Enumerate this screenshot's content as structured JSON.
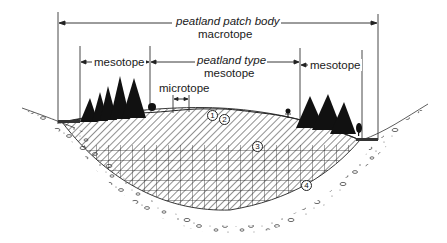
{
  "diagram": {
    "macrotope": {
      "title": "peatland patch body",
      "subtitle": "macrotope"
    },
    "mesotope_left": {
      "label": "mesotope"
    },
    "mesotope_center": {
      "title": "peatland type",
      "subtitle": "mesotope"
    },
    "mesotope_right": {
      "label": "mesotope"
    },
    "microtope": {
      "label": "microtope"
    },
    "layer_markers": [
      "1",
      "2",
      "3",
      "4"
    ],
    "colors": {
      "ink": "#1a1a1a",
      "background": "#ffffff"
    }
  }
}
